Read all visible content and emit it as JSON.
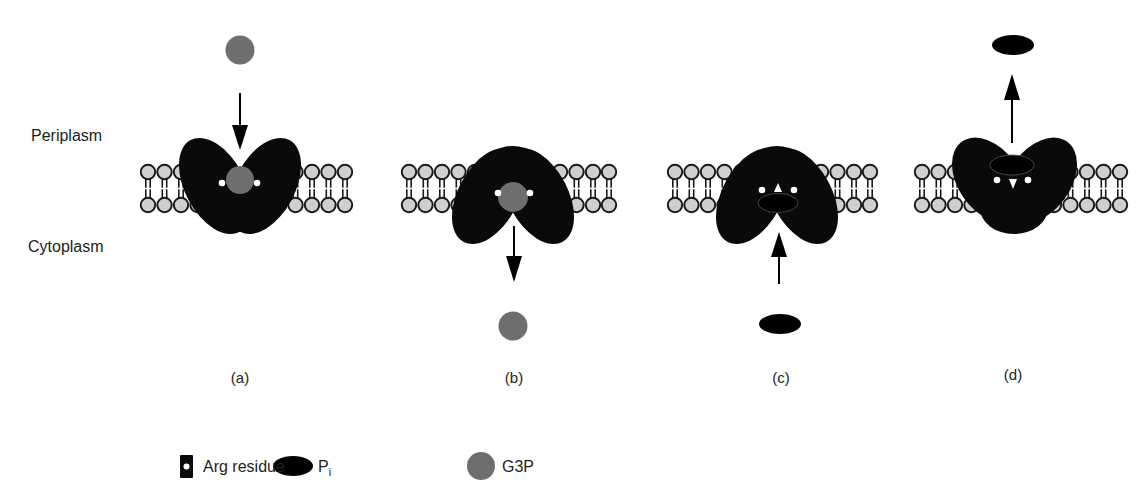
{
  "figure": {
    "type": "membrane-transport-cycle",
    "compartments": {
      "top": "Periplasm",
      "bottom": "Cytoplasm"
    },
    "panels": [
      {
        "id": "a",
        "label": "(a)",
        "state": "outward-open, G3P entering from periplasm",
        "substrate": "G3P",
        "arrow": "down"
      },
      {
        "id": "b",
        "label": "(b)",
        "state": "inward-open, G3P released to cytoplasm",
        "substrate": "G3P",
        "arrow": "down"
      },
      {
        "id": "c",
        "label": "(c)",
        "state": "inward-open, Pi entering from cytoplasm",
        "substrate": "Pi",
        "arrow": "up"
      },
      {
        "id": "d",
        "label": "(d)",
        "state": "outward-open, Pi released to periplasm",
        "substrate": "Pi",
        "arrow": "up"
      }
    ]
  },
  "legend": {
    "arg": {
      "label": "Arg residue"
    },
    "pi": {
      "label": "P",
      "subscript": "i"
    },
    "g3p": {
      "label": "G3P"
    }
  },
  "colors": {
    "protein": "#0a0a0a",
    "g3p": "#6e6e6e",
    "pi": "#000000",
    "lipid_head_fill": "#cfcfcf",
    "lipid_head_stroke": "#1a1a1a",
    "arg_residue": "#ffffff"
  }
}
